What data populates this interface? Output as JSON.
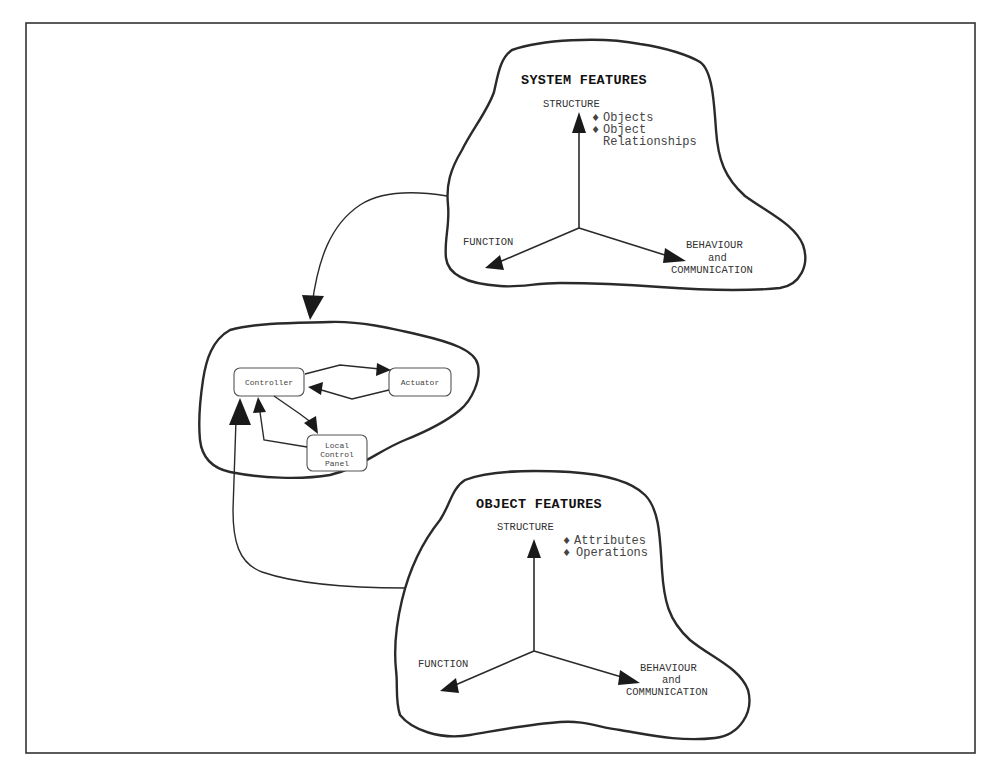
{
  "diagram": {
    "system_features": {
      "title": "SYSTEM FEATURES",
      "axes": {
        "structure": "STRUCTURE",
        "function": "FUNCTION",
        "behaviour": [
          "BEHAVIOUR",
          "and",
          "COMMUNICATION"
        ]
      },
      "structure_items": [
        "Objects",
        "Object",
        "Relationships"
      ],
      "bullet_glyph": "♦"
    },
    "system_model": {
      "nodes": [
        {
          "id": "controller",
          "label": "Controller"
        },
        {
          "id": "actuator",
          "label": "Actuator"
        },
        {
          "id": "panel",
          "label": [
            "Local",
            "Control",
            "Panel"
          ]
        }
      ],
      "edges": [
        {
          "from": "controller",
          "to": "actuator"
        },
        {
          "from": "actuator",
          "to": "controller"
        },
        {
          "from": "controller",
          "to": "panel"
        },
        {
          "from": "panel",
          "to": "controller"
        }
      ]
    },
    "object_features": {
      "title": "OBJECT FEATURES",
      "axes": {
        "structure": "STRUCTURE",
        "function": "FUNCTION",
        "behaviour": [
          "BEHAVIOUR",
          "and",
          "COMMUNICATION"
        ]
      },
      "structure_items": [
        "Attributes",
        "Operations"
      ],
      "bullet_glyph": "♦"
    },
    "connectors": [
      {
        "from": "system_features",
        "to": "system_model"
      },
      {
        "from": "object_features",
        "to": "system_model"
      }
    ]
  }
}
